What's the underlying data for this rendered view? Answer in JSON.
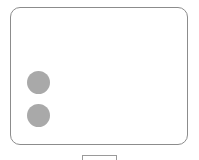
{
  "panel": {
    "border_color": "#8c8c8c",
    "background": "#ffffff"
  },
  "indicators": [
    {
      "name": "indicator-1",
      "color": "#a9a9a9"
    },
    {
      "name": "indicator-2",
      "color": "#a9a9a9"
    }
  ],
  "bottom_button": {
    "label": ""
  }
}
